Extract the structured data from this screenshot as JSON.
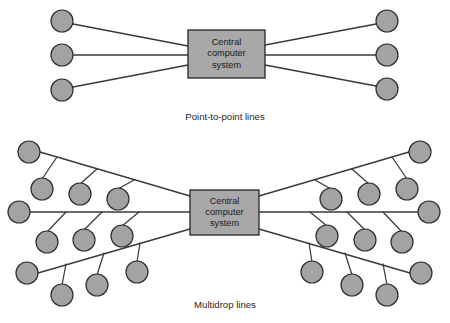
{
  "figure": {
    "type": "network-topology-diagram",
    "background_color": "#ffffff",
    "node_fill_color": "#a3a3a3",
    "node_stroke_color": "#2e2e2e",
    "box_fill_color": "#a8a8a8",
    "box_stroke_color": "#262626",
    "line_color": "#3a3a3a"
  },
  "panels": [
    {
      "id": "point-to-point",
      "caption": "Point-to-point lines",
      "caption_pos": {
        "x": 225,
        "y": 117
      },
      "hub": {
        "label_lines": [
          "Central",
          "computer",
          "system"
        ],
        "x": 188,
        "y": 30,
        "width": 77,
        "height": 48
      },
      "nodes": [
        {
          "id": "ptp-l1",
          "x": 62,
          "y": 21,
          "r": 11,
          "side": "left"
        },
        {
          "id": "ptp-l2",
          "x": 62,
          "y": 55,
          "r": 11,
          "side": "left"
        },
        {
          "id": "ptp-l3",
          "x": 62,
          "y": 90,
          "r": 11,
          "side": "left"
        },
        {
          "id": "ptp-r1",
          "x": 387,
          "y": 21,
          "r": 11,
          "side": "right"
        },
        {
          "id": "ptp-r2",
          "x": 387,
          "y": 55,
          "r": 11,
          "side": "right"
        },
        {
          "id": "ptp-r3",
          "x": 387,
          "y": 89,
          "r": 11,
          "side": "right"
        }
      ],
      "links": [
        {
          "from": [
            73,
            24
          ],
          "to": [
            188,
            46
          ]
        },
        {
          "from": [
            73,
            55
          ],
          "to": [
            188,
            55
          ]
        },
        {
          "from": [
            73,
            87
          ],
          "to": [
            188,
            65
          ]
        },
        {
          "from": [
            265,
            45
          ],
          "to": [
            376,
            24
          ]
        },
        {
          "from": [
            265,
            55
          ],
          "to": [
            376,
            55
          ]
        },
        {
          "from": [
            265,
            65
          ],
          "to": [
            376,
            86
          ]
        }
      ]
    },
    {
      "id": "multidrop",
      "caption": "Multidrop lines",
      "caption_pos": {
        "x": 225,
        "y": 305
      },
      "hub": {
        "label_lines": [
          "Central",
          "computer",
          "system"
        ],
        "x": 190,
        "y": 190,
        "width": 69,
        "height": 45
      },
      "trunks": [
        {
          "id": "ml-upper",
          "from": [
            40,
            152
          ],
          "to": [
            190,
            196
          ]
        },
        {
          "id": "ml-middle",
          "from": [
            30,
            212
          ],
          "to": [
            190,
            212
          ]
        },
        {
          "id": "ml-lower",
          "from": [
            38,
            273
          ],
          "to": [
            190,
            229
          ]
        },
        {
          "id": "mr-upper",
          "from": [
            259,
            196
          ],
          "to": [
            409,
            152
          ]
        },
        {
          "id": "mr-middle",
          "from": [
            259,
            212
          ],
          "to": [
            418,
            212
          ]
        },
        {
          "id": "mr-lower",
          "from": [
            259,
            229
          ],
          "to": [
            410,
            273
          ]
        }
      ],
      "terminal_nodes": [
        {
          "id": "ml-upper-end",
          "x": 29,
          "y": 152,
          "r": 11
        },
        {
          "id": "ml-middle-end",
          "x": 19,
          "y": 212,
          "r": 11
        },
        {
          "id": "ml-lower-end",
          "x": 27,
          "y": 273,
          "r": 11
        },
        {
          "id": "mr-upper-end",
          "x": 420,
          "y": 152,
          "r": 11
        },
        {
          "id": "mr-middle-end",
          "x": 429,
          "y": 212,
          "r": 11
        },
        {
          "id": "mr-lower-end",
          "x": 421,
          "y": 273,
          "r": 11
        }
      ],
      "drop_nodes": [
        {
          "id": "ml-u-d1",
          "tap": [
            57,
            157
          ],
          "x": 42,
          "y": 189,
          "r": 11
        },
        {
          "id": "ml-u-d2",
          "tap": [
            97,
            169
          ],
          "x": 80,
          "y": 194,
          "r": 11
        },
        {
          "id": "ml-u-d3",
          "tap": [
            134,
            180
          ],
          "x": 118,
          "y": 199,
          "r": 11
        },
        {
          "id": "ml-m-d1",
          "tap": [
            66,
            212
          ],
          "x": 47,
          "y": 242,
          "r": 11
        },
        {
          "id": "ml-m-d2",
          "tap": [
            102,
            212
          ],
          "x": 84,
          "y": 240,
          "r": 11
        },
        {
          "id": "ml-m-d3",
          "tap": [
            139,
            212
          ],
          "x": 122,
          "y": 236,
          "r": 11
        },
        {
          "id": "ml-l-d1",
          "tap": [
            66,
            264
          ],
          "x": 62,
          "y": 295,
          "r": 11
        },
        {
          "id": "ml-l-d2",
          "tap": [
            104,
            253
          ],
          "x": 97,
          "y": 285,
          "r": 11
        },
        {
          "id": "ml-l-d3",
          "tap": [
            140,
            243
          ],
          "x": 137,
          "y": 272,
          "r": 11
        },
        {
          "id": "mr-u-d1",
          "tap": [
            392,
            157
          ],
          "x": 407,
          "y": 189,
          "r": 11
        },
        {
          "id": "mr-u-d2",
          "tap": [
            352,
            169
          ],
          "x": 369,
          "y": 194,
          "r": 11
        },
        {
          "id": "mr-u-d3",
          "tap": [
            315,
            180
          ],
          "x": 331,
          "y": 199,
          "r": 11
        },
        {
          "id": "mr-m-d1",
          "tap": [
            383,
            212
          ],
          "x": 402,
          "y": 242,
          "r": 11
        },
        {
          "id": "mr-m-d2",
          "tap": [
            347,
            212
          ],
          "x": 365,
          "y": 240,
          "r": 11
        },
        {
          "id": "mr-m-d3",
          "tap": [
            310,
            212
          ],
          "x": 327,
          "y": 236,
          "r": 11
        },
        {
          "id": "mr-l-d1",
          "tap": [
            383,
            264
          ],
          "x": 387,
          "y": 295,
          "r": 11
        },
        {
          "id": "mr-l-d2",
          "tap": [
            345,
            253
          ],
          "x": 352,
          "y": 285,
          "r": 11
        },
        {
          "id": "mr-l-d3",
          "tap": [
            309,
            243
          ],
          "x": 312,
          "y": 272,
          "r": 11
        }
      ]
    }
  ]
}
